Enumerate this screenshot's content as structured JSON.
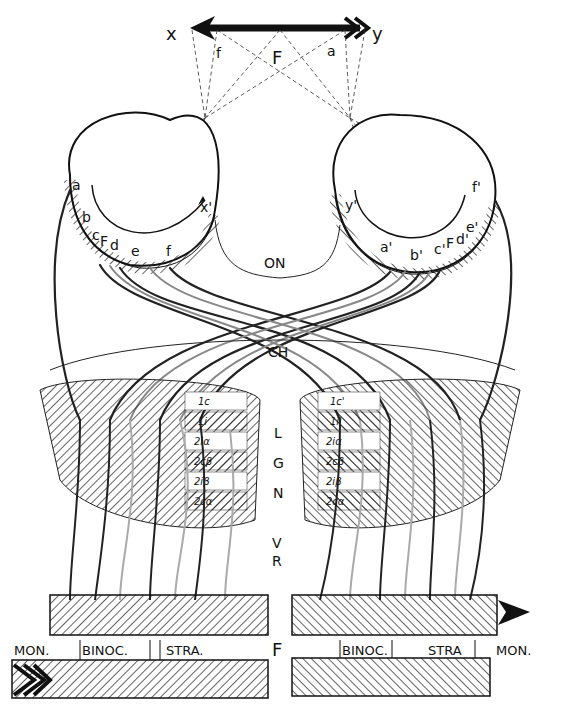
{
  "diagram": {
    "field_axis": {
      "left_label": "x",
      "right_label": "y",
      "center_label": "F",
      "left_point": "f",
      "right_point": "a"
    },
    "left_eye": {
      "labels": [
        "a",
        "b",
        "c",
        "F",
        "d",
        "e",
        "f"
      ],
      "arrow_label": "x'"
    },
    "right_eye": {
      "labels": [
        "a'",
        "b'",
        "c'",
        "F",
        "d'",
        "e'",
        "f'"
      ],
      "arrow_label": "y'"
    },
    "optic_nerve": "ON",
    "chiasm": "CH",
    "lgn": {
      "letters": [
        "L",
        "G",
        "N"
      ],
      "left_layers": [
        "1c",
        "1i",
        "2iα",
        "2cβ",
        "2iβ",
        "2cα"
      ],
      "right_layers": [
        "1c'",
        "1i'",
        "2iα",
        "2cβ",
        "2iβ",
        "2cα"
      ]
    },
    "radiation": {
      "letters": [
        "V",
        "R"
      ]
    },
    "cortex": {
      "label_f": "F",
      "left": {
        "mon": "MON.",
        "binoc": "BINOC.",
        "stra": "STRA."
      },
      "right": {
        "binoc": "BINOC.",
        "stra": "STRA",
        "mon": "MON."
      }
    }
  }
}
